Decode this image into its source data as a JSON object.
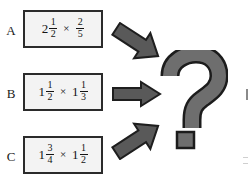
{
  "page": {
    "background_color": "#ffffff",
    "width": 249,
    "height": 174
  },
  "colors": {
    "box_border": "#2b2b2b",
    "box_fill": "#f3f3f3",
    "text": "#141414",
    "arrow_fill": "#595959",
    "arrow_outline": "#1e1e1e",
    "qmark_fill": "#6e6e6e",
    "qmark_outline": "#1c1c1c"
  },
  "rows": [
    {
      "label": "A",
      "arrow_icon": "arrow-down-right-icon",
      "arrow_direction": "down-right",
      "expression": {
        "left": {
          "whole": "2",
          "numerator": "1",
          "denominator": "2"
        },
        "operator": "×",
        "right": {
          "whole": "",
          "numerator": "2",
          "denominator": "5"
        }
      }
    },
    {
      "label": "B",
      "arrow_icon": "arrow-right-icon",
      "arrow_direction": "right",
      "expression": {
        "left": {
          "whole": "1",
          "numerator": "1",
          "denominator": "2"
        },
        "operator": "×",
        "right": {
          "whole": "1",
          "numerator": "1",
          "denominator": "3"
        }
      }
    },
    {
      "label": "C",
      "arrow_icon": "arrow-up-right-icon",
      "arrow_direction": "up-right",
      "expression": {
        "left": {
          "whole": "1",
          "numerator": "3",
          "denominator": "4"
        },
        "operator": "×",
        "right": {
          "whole": "1",
          "numerator": "1",
          "denominator": "2"
        }
      }
    }
  ],
  "question_mark": {
    "icon": "question-mark-icon",
    "glyph": "?"
  }
}
